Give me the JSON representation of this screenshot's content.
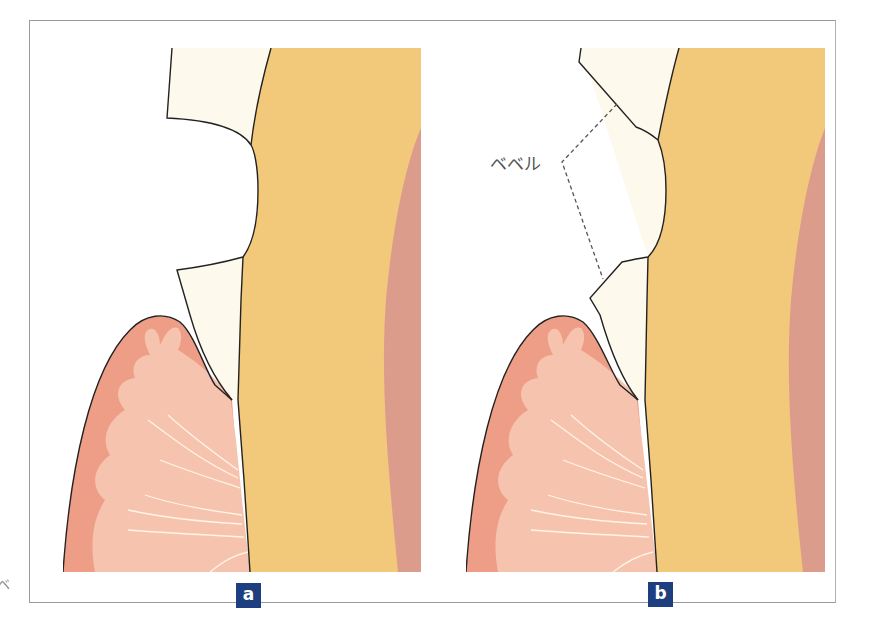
{
  "figure": {
    "panels": [
      {
        "id": "a",
        "label": "a",
        "layers": [
          "enamel",
          "dentin",
          "pulp",
          "gingiva",
          "periodontal-ligament-fibers"
        ],
        "margin_type": "butt-joint"
      },
      {
        "id": "b",
        "label": "b",
        "layers": [
          "enamel",
          "dentin",
          "pulp",
          "gingiva",
          "periodontal-ligament-fibers"
        ],
        "margin_type": "beveled",
        "annotation": {
          "text": "ベベル",
          "leader_style": "dashed"
        }
      }
    ],
    "stray_glyph": "ベ"
  },
  "colors": {
    "frame_border": "#9a9a9a",
    "enamel": "#fdf9ec",
    "dentin": "#f2c87a",
    "pulp": "#dc9c8c",
    "gingiva": "#ee9d87",
    "gingiva_inner": "#f6c3af",
    "fiber_lines": "#fff4e6",
    "outline": "#222222",
    "leader_line": "#555555",
    "label_bg": "#1d3f7f",
    "label_text": "#ffffff"
  }
}
